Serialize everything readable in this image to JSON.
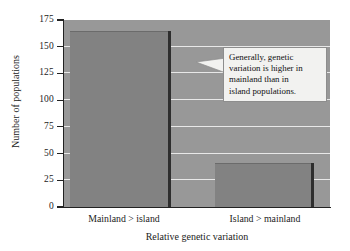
{
  "chart_data": {
    "type": "bar",
    "title": "",
    "xlabel": "Relative genetic variation",
    "ylabel": "Number of populations",
    "categories": [
      "Mainland > island",
      "Island > mainland"
    ],
    "values": [
      165,
      41
    ],
    "ylim": [
      0,
      175
    ],
    "yticks": [
      0,
      25,
      50,
      75,
      100,
      125,
      150,
      175
    ],
    "ytick_labels": [
      "0",
      "25",
      "50",
      "75",
      "100",
      "125",
      "150",
      "175"
    ],
    "grid": true,
    "legend": "none",
    "annotations": [
      {
        "lines": [
          "Generally, genetic",
          "variation is higher in",
          "mainland than in",
          "island populations."
        ],
        "text": "Generally, genetic variation is higher in mainland than in island populations.",
        "pointer": "left"
      }
    ],
    "colors": {
      "plot_background": "#989898",
      "gridline": "#e8e8e8",
      "bar": "#828282",
      "bar_shadow": "#2e2e2e",
      "axis": "#222222",
      "annotation_background": "#f2f2f0",
      "annotation_border": "#8d8d8d",
      "page_background": "#ffffff",
      "text": "#1b1b1b"
    }
  }
}
